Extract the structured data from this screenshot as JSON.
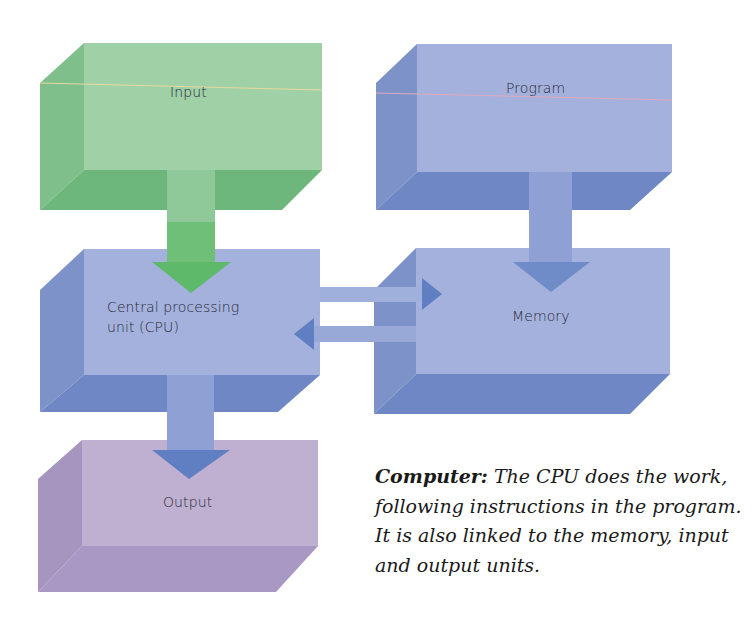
{
  "diagram": {
    "title": "Computer",
    "boxes": {
      "input": {
        "label": "Input",
        "color": "#8fc99a"
      },
      "program": {
        "label": "Program",
        "color": "#97a8d6"
      },
      "cpu": {
        "label_line1": "Central processing",
        "label_line2": "unit (CPU)",
        "color": "#97a8d6"
      },
      "memory": {
        "label": "Memory",
        "color": "#97a8d6"
      },
      "output": {
        "label": "Output",
        "color": "#b5a4cb"
      }
    },
    "arrows": [
      {
        "from": "input",
        "to": "cpu",
        "color": "#5fb96a"
      },
      {
        "from": "program",
        "to": "memory",
        "color": "#6f8bc8"
      },
      {
        "from": "cpu",
        "to": "memory",
        "color": "#6f8bc8"
      },
      {
        "from": "memory",
        "to": "cpu",
        "color": "#6f8bc8"
      },
      {
        "from": "cpu",
        "to": "output",
        "color": "#6f8bc8"
      }
    ]
  },
  "caption": {
    "heading": "Computer:",
    "text": " The CPU does the work, following instructions in the program. It is also linked to the memory, input and output units."
  }
}
